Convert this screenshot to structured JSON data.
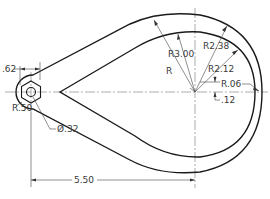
{
  "drawing": {
    "type": "mechanical engineering drawing",
    "subject": "teardrop-shaped link with hexagonal hole",
    "colors": {
      "line": "#1a1a1a",
      "dimension": "#444444",
      "background": "#ffffff"
    },
    "dimensions": {
      "hub_width": ".62",
      "hub_radius": "R.50",
      "hole_diameter": "Ø.32",
      "center_distance": "5.50",
      "outer_radius": "R3.00",
      "radius_unlabeled": "R",
      "rim_outer_radius": "R2.38",
      "rim_inner_radius": "R2.12",
      "fillet_radius": "R.06",
      "offset": ".12"
    }
  }
}
